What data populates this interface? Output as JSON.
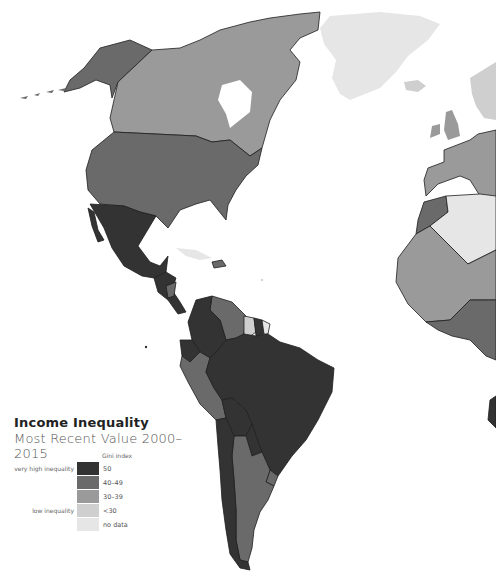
{
  "title": "Income Inequality",
  "subtitle": "Most Recent Value 2000–2015",
  "legend": {
    "header": "Gini index",
    "items": [
      {
        "label": "50",
        "description": "very high inequality",
        "color": "#333333"
      },
      {
        "label": "40–49",
        "description": "",
        "color": "#6a6a6a"
      },
      {
        "label": "30–39",
        "description": "",
        "color": "#9a9a9a"
      },
      {
        "label": "<30",
        "description": "low inequality",
        "color": "#cfcfcf"
      },
      {
        "label": "no data",
        "description": "",
        "color": "#e6e6e6"
      }
    ]
  },
  "colors": {
    "very_high": "#333333",
    "high": "#6a6a6a",
    "medium": "#9a9a9a",
    "low": "#cfcfcf",
    "no_data": "#e6e6e6",
    "border": "#1e1e1e"
  },
  "regions": [
    {
      "name": "Alaska (USA)",
      "category": "40–49"
    },
    {
      "name": "Canada",
      "category": "30–39"
    },
    {
      "name": "United States",
      "category": "40–49"
    },
    {
      "name": "Greenland",
      "category": "no data"
    },
    {
      "name": "Iceland",
      "category": "<30"
    },
    {
      "name": "Mexico",
      "category": "50"
    },
    {
      "name": "Central America",
      "category": "50"
    },
    {
      "name": "Nicaragua",
      "category": "40–49"
    },
    {
      "name": "Colombia",
      "category": "50"
    },
    {
      "name": "Venezuela",
      "category": "40–49"
    },
    {
      "name": "Guyana",
      "category": "<30"
    },
    {
      "name": "Suriname",
      "category": "50"
    },
    {
      "name": "French Guiana",
      "category": "no data"
    },
    {
      "name": "Ecuador",
      "category": "50"
    },
    {
      "name": "Peru",
      "category": "40–49"
    },
    {
      "name": "Brazil",
      "category": "50"
    },
    {
      "name": "Bolivia",
      "category": "50"
    },
    {
      "name": "Paraguay",
      "category": "50"
    },
    {
      "name": "Chile",
      "category": "50"
    },
    {
      "name": "Argentina",
      "category": "40–49"
    },
    {
      "name": "Uruguay",
      "category": "40–49"
    },
    {
      "name": "Hispaniola",
      "category": "40–49"
    },
    {
      "name": "Cuba",
      "category": "no data"
    },
    {
      "name": "Western Europe",
      "category": "30–39"
    },
    {
      "name": "Scandinavia",
      "category": "<30"
    },
    {
      "name": "Morocco",
      "category": "40–49"
    },
    {
      "name": "Algeria",
      "category": "no data"
    },
    {
      "name": "West Africa",
      "category": "30–39"
    },
    {
      "name": "Coastal West Africa",
      "category": "40–49"
    }
  ]
}
